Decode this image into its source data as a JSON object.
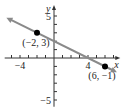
{
  "chart_data": {
    "type": "line",
    "title": "",
    "xlabel": "x",
    "ylabel": "y",
    "xlim": [
      -5.8,
      7.8
    ],
    "ylim": [
      -5.8,
      6.3
    ],
    "grid": false,
    "ticks": {
      "x": [
        -5,
        -4,
        -3,
        -2,
        -1,
        1,
        2,
        3,
        4,
        5,
        6,
        7
      ],
      "y": [
        -5,
        -4,
        -3,
        -2,
        -1,
        1,
        2,
        3,
        4,
        5
      ]
    },
    "tick_labels": {
      "x": [
        {
          "value": -4,
          "label": "−4"
        },
        {
          "value": 4,
          "label": "4"
        }
      ],
      "y": [
        {
          "value": 5,
          "label": "5"
        },
        {
          "value": -5,
          "label": "−5"
        }
      ]
    },
    "line": {
      "slope": -0.5,
      "intercept": 2,
      "x_range": [
        -5.6,
        7.4
      ],
      "color": "#8a8a8a",
      "arrows": "both"
    },
    "points": [
      {
        "x": -2,
        "y": 3,
        "label": "(−2, 3)"
      },
      {
        "x": 6,
        "y": -1,
        "label": "(6, −1)"
      }
    ],
    "colors": {
      "axis": "#333333",
      "line": "#8a8a8a",
      "point": "#000000",
      "text": "#222222"
    }
  }
}
